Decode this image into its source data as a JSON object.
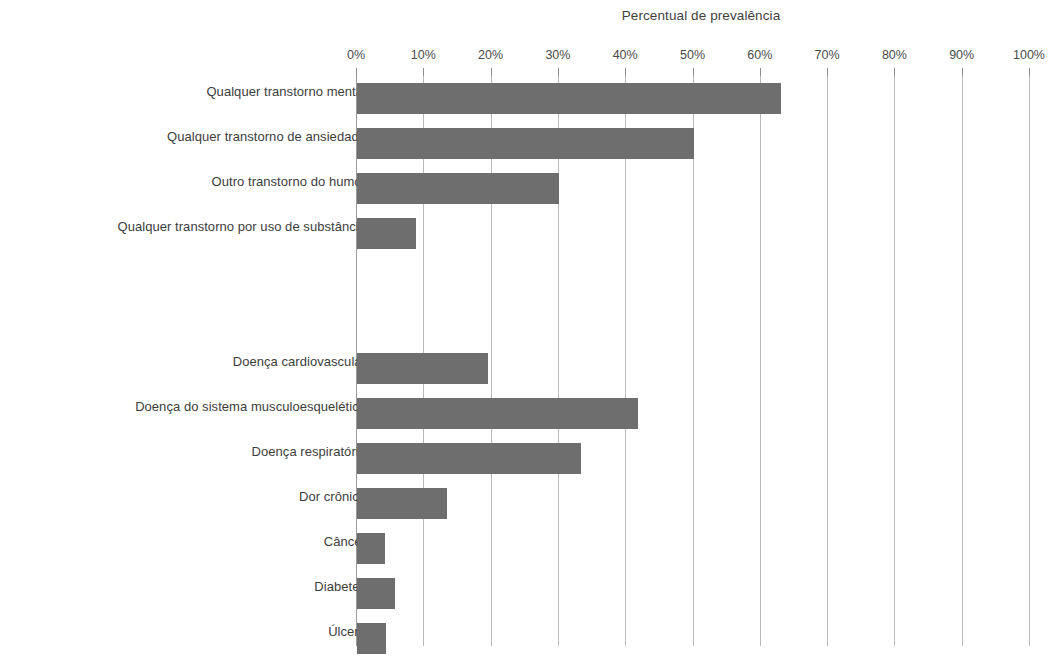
{
  "chart_data": {
    "type": "bar",
    "orientation": "horizontal",
    "title": "Percentual de prevalência",
    "xlabel": "",
    "ylabel": "",
    "xlim": [
      0,
      100
    ],
    "xticks": [
      0,
      10,
      20,
      30,
      40,
      50,
      60,
      70,
      80,
      90,
      100
    ],
    "xticklabels": [
      "0%",
      "10%",
      "20%",
      "30%",
      "40%",
      "50%",
      "60%",
      "70%",
      "80%",
      "90%",
      "100%"
    ],
    "grid": true,
    "legend": "none",
    "bar_color": "#6e6e6e",
    "categories": [
      "Qualquer transtorno mental",
      "Qualquer transtorno de ansiedade",
      "Outro transtorno do humor",
      "Qualquer transtorno por uso de substância",
      "",
      "",
      "Doença cardiovascular",
      "Doença do sistema musculoesquelético",
      "Doença respiratória",
      "Dor crônica",
      "Câncer",
      "Diabetes",
      "Úlcera"
    ],
    "values": [
      63.0,
      50.0,
      30.0,
      8.7,
      null,
      null,
      19.5,
      41.8,
      33.3,
      13.4,
      4.2,
      5.7,
      4.3
    ]
  },
  "bottom_caption": {
    "text": ""
  }
}
